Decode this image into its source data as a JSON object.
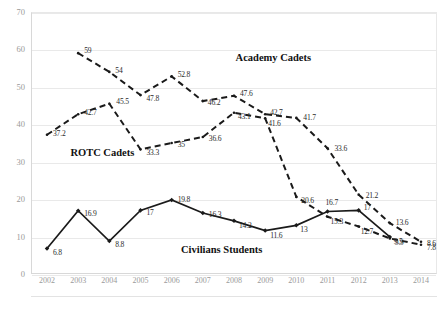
{
  "chart_data": {
    "type": "line",
    "title": "",
    "xlabel": "",
    "ylabel": "",
    "ylim": [
      0,
      70
    ],
    "yticks": [
      "0",
      "10",
      "20",
      "30",
      "40",
      "50",
      "60",
      "70"
    ],
    "grid": true,
    "legend_position": "inline-annotations",
    "categories": [
      "2002",
      "2003",
      "2004",
      "2005",
      "2006",
      "2007",
      "2008",
      "2009",
      "2010",
      "2011",
      "2012",
      "2013",
      "2014"
    ],
    "series": [
      {
        "name": "ROTC Cadets",
        "style": "dashed",
        "color": "#1a1a1a",
        "values": [
          37.2,
          42.7,
          45.5,
          33.3,
          35,
          36.6,
          43.1,
          41.6,
          20.6,
          15.3,
          12.7,
          9.5,
          7.8
        ],
        "labels": [
          "37.2",
          "42.7",
          "45.5",
          "33.3",
          "35",
          "36.6",
          "43.1",
          "41.6",
          "20.6",
          "15.3",
          "12.7",
          "9.5",
          "7.8"
        ]
      },
      {
        "name": "Academy Cadets",
        "style": "dashed",
        "color": "#1a1a1a",
        "values": [
          null,
          59,
          54,
          47.8,
          52.8,
          46.2,
          47.6,
          42.7,
          41.7,
          33.6,
          21.2,
          13.6,
          8.6
        ],
        "labels": [
          "",
          "59",
          "54",
          "47.8",
          "52.8",
          "46.2",
          "47.6",
          "42.7",
          "41.7",
          "33.6",
          "21.2",
          "13.6",
          "8.6"
        ]
      },
      {
        "name": "Civilians Students",
        "style": "solid",
        "color": "#1a1a1a",
        "values": [
          6.8,
          16.9,
          8.8,
          17,
          19.8,
          16.3,
          14.2,
          11.6,
          13,
          16.7,
          17,
          9.9,
          null
        ],
        "labels": [
          "6.8",
          "16.9",
          "8.8",
          "17",
          "19.8",
          "16.3",
          "14.2",
          "11.6",
          "13",
          "16.7",
          "17",
          "9.9",
          ""
        ]
      }
    ],
    "annotations": [
      {
        "text": "Academy Cadets",
        "x": 2008.05,
        "y": 57.5
      },
      {
        "text": "ROTC Cadets",
        "x": 2002.75,
        "y": 32.0
      },
      {
        "text": "Civilians Students",
        "x": 2006.3,
        "y": 6.2
      }
    ]
  }
}
